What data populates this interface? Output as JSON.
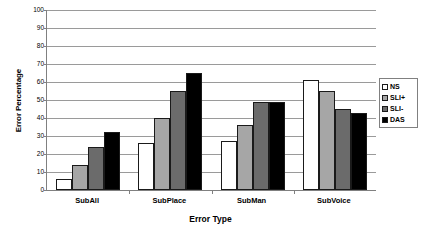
{
  "chart_data": {
    "type": "bar",
    "title": "",
    "xlabel": "Error Type",
    "ylabel": "Error Percentage",
    "categories": [
      "SubAll",
      "SubPlace",
      "SubMan",
      "SubVoice"
    ],
    "series": [
      {
        "name": "NS",
        "color": "#ffffff",
        "values": [
          6,
          26,
          27,
          61
        ]
      },
      {
        "name": "SLI+",
        "color": "#a6a6a6",
        "values": [
          14,
          40,
          36,
          55
        ]
      },
      {
        "name": "SLI-",
        "color": "#6b6b6b",
        "values": [
          24,
          55,
          49,
          45
        ]
      },
      {
        "name": "DAS",
        "color": "#000000",
        "values": [
          32,
          65,
          49,
          43
        ]
      }
    ],
    "ylim": [
      0,
      100
    ],
    "ytick_step": 10,
    "yticks": [
      100,
      90,
      80,
      70,
      60,
      50,
      40,
      30,
      20,
      10,
      0
    ],
    "grid": true,
    "legend_position": "right"
  },
  "legend": {
    "entries": [
      {
        "label": "NS"
      },
      {
        "label": "SLI+"
      },
      {
        "label": "SLI-"
      },
      {
        "label": "DAS"
      }
    ]
  }
}
